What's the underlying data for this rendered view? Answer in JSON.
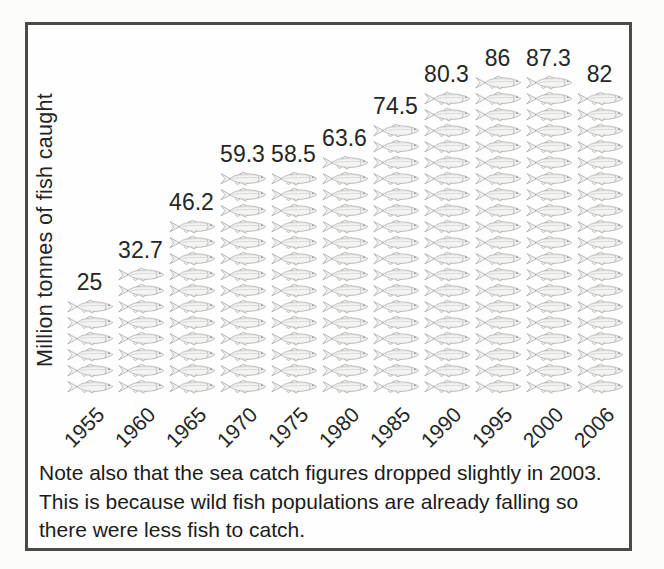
{
  "chart_data": {
    "type": "bar",
    "subtype": "pictogram",
    "title": "",
    "ylabel": "Million tonnes of fish caught",
    "xlabel": "",
    "categories": [
      "1955",
      "1960",
      "1965",
      "1970",
      "1975",
      "1980",
      "1985",
      "1990",
      "1995",
      "2000",
      "2006"
    ],
    "values": [
      25,
      32.7,
      46.2,
      59.3,
      58.5,
      63.6,
      74.5,
      80.3,
      86,
      87.3,
      82
    ],
    "value_labels": [
      "25",
      "32.7",
      "46.2",
      "59.3",
      "58.5",
      "63.6",
      "74.5",
      "80.3",
      "86",
      "87.3",
      "82"
    ],
    "icon": "fish-icon",
    "icon_counts": [
      6,
      8,
      11,
      14,
      14,
      15,
      17,
      19,
      20,
      20,
      19
    ],
    "unit": "million tonnes",
    "legend_position": "none",
    "grid": false,
    "x_tick_rotation_deg": -45
  },
  "note": {
    "text": "Note also that the sea catch figures dropped slightly in 2003. This is because wild fish populations are already falling so there were less fish to catch."
  },
  "colors": {
    "frame": "#4a4a4a",
    "text": "#1e1e1e",
    "fish_outline": "#a2a2a2",
    "fish_fill": "#f4f4f3",
    "background": "#fefefe"
  }
}
